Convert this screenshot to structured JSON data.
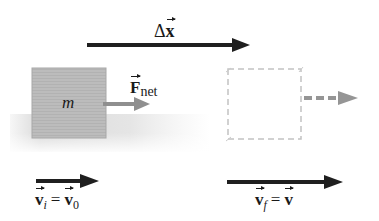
{
  "diagram": {
    "displacement": {
      "symbol": "Δ",
      "var": "x",
      "label_text": "Δx"
    },
    "block": {
      "mass_label": "m"
    },
    "force": {
      "symbol": "F",
      "subscript": "net"
    },
    "initial_velocity": {
      "lhs": "v",
      "lhs_sub": "i",
      "equals": "=",
      "rhs": "v",
      "rhs_sub": "0"
    },
    "final_velocity": {
      "lhs": "v",
      "lhs_sub": "f",
      "equals": "=",
      "rhs": "v"
    },
    "colors": {
      "dark_arrow": "#1f1f1f",
      "gray_arrow": "#8f8f8f",
      "block_fill": "#b9b9b9",
      "block_border": "#a5a5a5",
      "dashed_box": "#c4c4c4",
      "shadow": "#d9d9d9"
    }
  }
}
